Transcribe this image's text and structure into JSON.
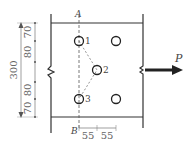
{
  "diagram": {
    "type": "bolted-plate-connection",
    "section_labels": {
      "top": "A",
      "bottom": "B"
    },
    "force": {
      "label": "P",
      "direction": "right"
    },
    "hole_labels": [
      "1",
      "2",
      "3"
    ],
    "dimensions": {
      "overall_height": "300",
      "vertical_spacings": [
        "70",
        "80",
        "80",
        "70"
      ],
      "horizontal_spacings": [
        "55",
        "55"
      ]
    },
    "colors": {
      "line": "#333333",
      "dashed": "#555555",
      "dim": "#777777",
      "text": "#444444"
    }
  }
}
